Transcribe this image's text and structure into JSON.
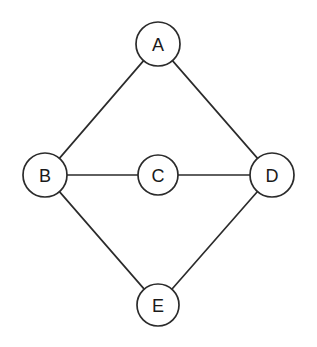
{
  "diagram": {
    "type": "node-link-graph",
    "canvas": {
      "width": 317,
      "height": 347,
      "background": "#ffffff"
    },
    "style": {
      "stroke_color": "#2b2b2b",
      "node_fill": "#ffffff",
      "label_color": "#1a1a1a",
      "stroke_width": 1.7,
      "label_font_size": 18
    },
    "nodes": [
      {
        "id": "A",
        "label": "A",
        "cx": 158,
        "cy": 44,
        "r": 22
      },
      {
        "id": "B",
        "label": "B",
        "cx": 45,
        "cy": 175,
        "r": 22
      },
      {
        "id": "C",
        "label": "C",
        "cx": 158,
        "cy": 175,
        "r": 20
      },
      {
        "id": "D",
        "label": "D",
        "cx": 272,
        "cy": 175,
        "r": 22
      },
      {
        "id": "E",
        "label": "E",
        "cx": 158,
        "cy": 305,
        "r": 21
      }
    ],
    "edges": [
      {
        "id": "A-B",
        "from": "A",
        "to": "B",
        "x1": 142,
        "y1": 59,
        "x2": 61,
        "y2": 160
      },
      {
        "id": "A-D",
        "from": "A",
        "to": "D",
        "x1": 174,
        "y1": 59,
        "x2": 257,
        "y2": 160
      },
      {
        "id": "B-C",
        "from": "B",
        "to": "C",
        "x1": 67,
        "y1": 175,
        "x2": 138,
        "y2": 175
      },
      {
        "id": "C-D",
        "from": "C",
        "to": "D",
        "x1": 178,
        "y1": 175,
        "x2": 250,
        "y2": 175
      },
      {
        "id": "B-E",
        "from": "B",
        "to": "E",
        "x1": 59,
        "y1": 192,
        "x2": 143,
        "y2": 292
      },
      {
        "id": "D-E",
        "from": "D",
        "to": "E",
        "x1": 258,
        "y1": 192,
        "x2": 173,
        "y2": 292
      }
    ]
  }
}
